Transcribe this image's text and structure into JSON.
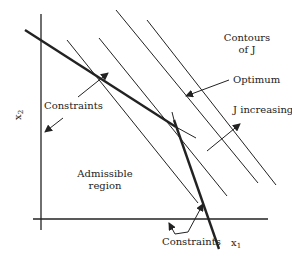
{
  "diagram": {
    "title": "",
    "colors": {
      "ink": "#222222",
      "background": "#ffffff"
    },
    "axes": {
      "x_label": "x",
      "x_sub": "1",
      "y_label": "x",
      "y_sub": "2"
    },
    "labels": {
      "contours_line1": "Contours",
      "contours_line2": "of J",
      "optimum": "Optimum",
      "j_increasing": "J increasing",
      "constraints_top": "Constraints",
      "constraints_bottom": "Constraints",
      "admissible_line1": "Admissible",
      "admissible_line2": "region"
    }
  }
}
